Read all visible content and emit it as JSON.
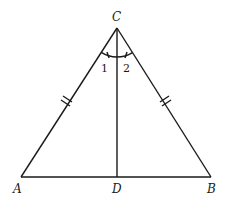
{
  "diagram": {
    "type": "geometry",
    "points": {
      "A": {
        "label": "A",
        "x": 21,
        "y": 177
      },
      "B": {
        "label": "B",
        "x": 211,
        "y": 177
      },
      "C": {
        "label": "C",
        "x": 117,
        "y": 28
      },
      "D": {
        "label": "D",
        "x": 117,
        "y": 177
      }
    },
    "segments": [
      "AC",
      "BC",
      "AB",
      "CD"
    ],
    "congruent_marks": {
      "AC": "double-tick",
      "BC": "double-tick"
    },
    "angles": [
      {
        "label": "1",
        "between": [
          "CA",
          "CD"
        ]
      },
      {
        "label": "2",
        "between": [
          "CD",
          "CB"
        ]
      }
    ],
    "stroke_color": "#1a1a1a"
  }
}
